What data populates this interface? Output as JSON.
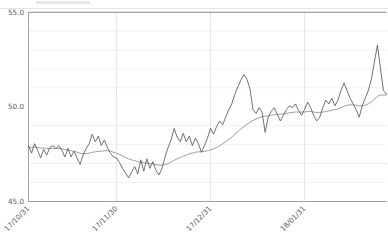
{
  "chart_data": {
    "type": "line",
    "title": "",
    "subtitle": "",
    "xlabel": "",
    "ylabel": "",
    "grid": true,
    "legend_position": "none",
    "ylim": [
      45.0,
      55.0
    ],
    "ytick_values": [
      45.0,
      50.0,
      55.0
    ],
    "ytick_labels": [
      "45.0",
      "50.0",
      "55.0"
    ],
    "y_minor_step": 1.0,
    "xtick_labels": [
      "17/10/31",
      "17/11/30",
      "17/12/31",
      "18/01/31"
    ],
    "xtick_positions": [
      0,
      29,
      60,
      91
    ],
    "xlim": [
      0,
      118
    ],
    "xtick_rotation_deg": 45,
    "series": [
      {
        "name": "price",
        "color": "#585860",
        "x": [
          0,
          1,
          2,
          3,
          4,
          5,
          6,
          7,
          8,
          9,
          10,
          11,
          12,
          13,
          14,
          15,
          16,
          17,
          18,
          19,
          20,
          21,
          22,
          23,
          24,
          25,
          26,
          27,
          28,
          29,
          30,
          31,
          32,
          33,
          34,
          35,
          36,
          37,
          38,
          39,
          40,
          41,
          42,
          43,
          44,
          45,
          46,
          47,
          48,
          49,
          50,
          51,
          52,
          53,
          54,
          55,
          56,
          57,
          58,
          59,
          60,
          61,
          62,
          63,
          64,
          65,
          66,
          67,
          68,
          69,
          70,
          71,
          72,
          73,
          74,
          75,
          76,
          77,
          78,
          79,
          80,
          81,
          82,
          83,
          84,
          85,
          86,
          87,
          88,
          89,
          90,
          91,
          92,
          93,
          94,
          95,
          96,
          97,
          98,
          99,
          100,
          101,
          102,
          103,
          104,
          105,
          106,
          107,
          108,
          109,
          110,
          111,
          112,
          113,
          114,
          115,
          116,
          117,
          118
        ],
        "values": [
          47.95,
          47.55,
          48.05,
          47.7,
          47.3,
          47.75,
          47.45,
          47.85,
          47.95,
          47.8,
          47.95,
          47.7,
          47.35,
          47.8,
          47.35,
          47.65,
          47.3,
          46.95,
          47.45,
          47.8,
          48.05,
          48.55,
          48.15,
          48.45,
          47.95,
          48.25,
          47.85,
          47.55,
          47.35,
          47.3,
          47.05,
          46.75,
          46.5,
          46.25,
          46.55,
          46.85,
          46.45,
          47.2,
          46.6,
          47.25,
          46.75,
          47.1,
          46.65,
          46.4,
          46.75,
          47.35,
          47.85,
          48.25,
          48.85,
          48.4,
          48.15,
          48.6,
          48.15,
          48.45,
          47.95,
          48.35,
          48.05,
          47.6,
          47.95,
          48.35,
          48.85,
          48.55,
          48.95,
          49.25,
          49.05,
          49.45,
          49.85,
          50.15,
          50.65,
          51.05,
          51.4,
          51.7,
          51.45,
          50.95,
          49.85,
          49.65,
          49.95,
          49.7,
          48.65,
          49.45,
          49.75,
          49.95,
          49.6,
          49.25,
          49.55,
          49.85,
          50.05,
          49.95,
          50.15,
          49.8,
          49.55,
          49.85,
          50.25,
          49.95,
          49.55,
          49.25,
          49.45,
          49.95,
          50.35,
          50.15,
          50.45,
          50.05,
          50.35,
          50.85,
          51.25,
          50.85,
          50.45,
          50.15,
          49.85,
          49.45,
          50.05,
          50.45,
          50.85,
          51.45,
          52.35,
          53.25,
          52.05,
          50.85,
          50.65
        ]
      },
      {
        "name": "moving-average",
        "color": "#8d8d96",
        "x": [
          0,
          1,
          2,
          3,
          4,
          5,
          6,
          7,
          8,
          9,
          10,
          11,
          12,
          13,
          14,
          15,
          16,
          17,
          18,
          19,
          20,
          21,
          22,
          23,
          24,
          25,
          26,
          27,
          28,
          29,
          30,
          31,
          32,
          33,
          34,
          35,
          36,
          37,
          38,
          39,
          40,
          41,
          42,
          43,
          44,
          45,
          46,
          47,
          48,
          49,
          50,
          51,
          52,
          53,
          54,
          55,
          56,
          57,
          58,
          59,
          60,
          61,
          62,
          63,
          64,
          65,
          66,
          67,
          68,
          69,
          70,
          71,
          72,
          73,
          74,
          75,
          76,
          77,
          78,
          79,
          80,
          81,
          82,
          83,
          84,
          85,
          86,
          87,
          88,
          89,
          90,
          91,
          92,
          93,
          94,
          95,
          96,
          97,
          98,
          99,
          100,
          101,
          102,
          103,
          104,
          105,
          106,
          107,
          108,
          109,
          110,
          111,
          112,
          113,
          114,
          115,
          116,
          117,
          118
        ],
        "values": [
          47.85,
          47.85,
          47.88,
          47.85,
          47.82,
          47.82,
          47.8,
          47.8,
          47.8,
          47.8,
          47.8,
          47.78,
          47.75,
          47.72,
          47.68,
          47.65,
          47.6,
          47.55,
          47.52,
          47.52,
          47.55,
          47.6,
          47.62,
          47.65,
          47.65,
          47.68,
          47.68,
          47.65,
          47.6,
          47.55,
          47.48,
          47.4,
          47.32,
          47.25,
          47.2,
          47.15,
          47.1,
          47.08,
          47.05,
          47.02,
          47.0,
          46.98,
          46.95,
          46.92,
          46.92,
          46.95,
          47.0,
          47.08,
          47.18,
          47.25,
          47.32,
          47.4,
          47.45,
          47.52,
          47.55,
          47.6,
          47.62,
          47.62,
          47.65,
          47.68,
          47.72,
          47.78,
          47.85,
          47.95,
          48.05,
          48.15,
          48.28,
          48.4,
          48.55,
          48.68,
          48.82,
          48.95,
          49.08,
          49.18,
          49.28,
          49.35,
          49.42,
          49.48,
          49.5,
          49.52,
          49.55,
          49.58,
          49.6,
          49.6,
          49.62,
          49.65,
          49.68,
          49.7,
          49.72,
          49.72,
          49.72,
          49.72,
          49.75,
          49.75,
          49.72,
          49.7,
          49.7,
          49.72,
          49.75,
          49.78,
          49.82,
          49.85,
          49.88,
          49.95,
          50.02,
          50.08,
          50.1,
          50.1,
          50.08,
          50.05,
          50.05,
          50.08,
          50.15,
          50.25,
          50.4,
          50.55,
          50.62,
          50.62,
          50.62
        ]
      }
    ],
    "annotations": []
  },
  "axes": {
    "y_label_top": "55.0",
    "y_label_mid": "50.0",
    "y_label_bottom": "45.0",
    "x_label_1": "17/10/31",
    "x_label_2": "17/11/30",
    "x_label_3": "17/12/31",
    "x_label_4": "18/01/31"
  },
  "colors": {
    "background": "#ffffff",
    "grid_minor": "#e9e9ec",
    "grid_major": "#b9b9bd",
    "grid_vertical": "#dedee2",
    "axis": "#9a9a9e",
    "series_price": "#585860",
    "series_ma": "#8d8d96",
    "tick_text": "#5a5a5a"
  }
}
